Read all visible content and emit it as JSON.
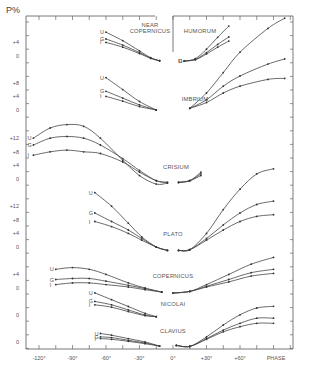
{
  "chart_data": {
    "type": "line",
    "title": "",
    "ylabel": "P%",
    "xlabel": "PHASE",
    "x_ticks": [
      "-120°",
      "-90°",
      "-60°",
      "-30°",
      "0°",
      "+30°",
      "+60°",
      "PHASE"
    ],
    "x_tick_values": [
      -120,
      -90,
      -60,
      -30,
      0,
      30,
      60
    ],
    "xlim": [
      -135,
      105
    ],
    "series_labels": [
      "U",
      "G",
      "I"
    ],
    "grid": false,
    "panels": [
      {
        "name": "NEAR COPERNICUS",
        "y_ticks": [
          "+4",
          "0"
        ],
        "baseline_px": 56,
        "series": [
          {
            "name": "U",
            "x": [
              -60,
              -45,
              -30,
              -20,
              -12
            ],
            "values": [
              7.0,
              4.5,
              1.5,
              -0.5,
              -1.4
            ]
          },
          {
            "name": "G",
            "x": [
              -60,
              -45,
              -30,
              -20,
              -12
            ],
            "values": [
              5.0,
              3.2,
              1.0,
              -0.6,
              -1.4
            ]
          },
          {
            "name": "I",
            "x": [
              -60,
              -45,
              -30,
              -20,
              -12
            ],
            "values": [
              4.0,
              2.6,
              0.7,
              -0.7,
              -1.4
            ]
          }
        ]
      },
      {
        "name": "HUMORUM",
        "y_ticks": [],
        "baseline_px": 56,
        "series": [
          {
            "name": "U",
            "x": [
              10,
              20,
              30,
              40,
              50
            ],
            "values": [
              -1.5,
              -0.8,
              2.0,
              5.5,
              8.8
            ]
          },
          {
            "name": "G",
            "x": [
              10,
              20,
              30,
              40,
              50
            ],
            "values": [
              -1.5,
              -1.0,
              1.0,
              3.4,
              5.6
            ]
          },
          {
            "name": "I",
            "x": [
              10,
              20,
              30,
              40,
              50
            ],
            "values": [
              -1.5,
              -1.1,
              0.6,
              2.6,
              4.4
            ]
          }
        ]
      },
      {
        "name": "IMBRIUM",
        "y_ticks": [
          "+8",
          "+4",
          "0"
        ],
        "baseline_px": 110,
        "series": [
          {
            "name": "U",
            "x": [
              -60,
              -45,
              -30,
              -15,
              15,
              30,
              45,
              60,
              85,
              100
            ],
            "values": [
              9.5,
              6.0,
              2.5,
              0.0,
              0.5,
              5.0,
              11.0,
              17.0,
              24.0,
              27.0
            ]
          },
          {
            "name": "G",
            "x": [
              -60,
              -45,
              -30,
              -15,
              15,
              30,
              45,
              60,
              85,
              100
            ],
            "values": [
              5.5,
              3.5,
              1.5,
              0.0,
              0.5,
              3.0,
              7.0,
              10.0,
              13.5,
              15.0
            ]
          },
          {
            "name": "I",
            "x": [
              -60,
              -45,
              -30,
              -15,
              15,
              30,
              45,
              60,
              85,
              100
            ],
            "values": [
              4.0,
              2.6,
              1.0,
              0.0,
              0.5,
              2.2,
              5.0,
              7.0,
              9.0,
              9.3
            ]
          }
        ]
      },
      {
        "name": "CRISIUM",
        "y_ticks": [
          "+12",
          "+8",
          "+4",
          "0"
        ],
        "baseline_px": 179,
        "series": [
          {
            "name": "U",
            "x": [
              -125,
              -110,
              -95,
              -80,
              -65,
              -45,
              -30,
              -15,
              -5,
              5,
              15,
              25
            ],
            "values": [
              12.0,
              15.0,
              16.0,
              15.5,
              12.0,
              5.5,
              1.0,
              -1.5,
              -1.2,
              -1.0,
              -0.5,
              2.0
            ]
          },
          {
            "name": "G",
            "x": [
              -125,
              -110,
              -95,
              -80,
              -65,
              -45,
              -30,
              -15,
              -5,
              5,
              15,
              25
            ],
            "values": [
              10.0,
              12.0,
              12.5,
              12.0,
              10.0,
              6.0,
              2.5,
              -0.5,
              -1.0,
              -1.0,
              -0.5,
              1.5
            ]
          },
          {
            "name": "I",
            "x": [
              -125,
              -110,
              -95,
              -80,
              -65,
              -45,
              -30,
              -15,
              -5,
              5,
              15,
              25
            ],
            "values": [
              7.0,
              8.0,
              8.5,
              8.0,
              7.5,
              5.0,
              2.0,
              -0.5,
              -1.0,
              -1.0,
              -0.5,
              1.0
            ]
          }
        ]
      },
      {
        "name": "PLATO",
        "y_ticks": [
          "+12",
          "+8",
          "+4",
          "0"
        ],
        "baseline_px": 247,
        "series": [
          {
            "name": "U",
            "x": [
              -70,
              -55,
              -40,
              -28,
              -15,
              -5,
              5,
              15,
              30,
              45,
              60,
              75,
              90
            ],
            "values": [
              16.0,
              12.0,
              7.0,
              3.0,
              0.0,
              -1.0,
              -1.0,
              -0.8,
              4.0,
              11.0,
              17.0,
              21.5,
              23.0
            ]
          },
          {
            "name": "G",
            "x": [
              -70,
              -55,
              -40,
              -28,
              -15,
              -5,
              5,
              15,
              30,
              45,
              60,
              75,
              90
            ],
            "values": [
              10.0,
              7.5,
              5.0,
              2.5,
              0.0,
              -1.0,
              -1.0,
              -0.8,
              2.5,
              6.5,
              10.0,
              12.5,
              13.5
            ]
          },
          {
            "name": "I",
            "x": [
              -70,
              -55,
              -40,
              -28,
              -15,
              -5,
              5,
              15,
              30,
              45,
              60,
              75,
              90
            ],
            "values": [
              7.5,
              6.0,
              4.0,
              2.0,
              0.0,
              -1.0,
              -1.0,
              -0.8,
              2.0,
              5.0,
              7.5,
              9.0,
              9.5
            ]
          }
        ]
      },
      {
        "name": "COPERNICUS",
        "y_ticks": [
          "+4",
          "0"
        ],
        "baseline_px": 288,
        "series": [
          {
            "name": "U",
            "x": [
              -105,
              -90,
              -75,
              -60,
              -40,
              -25,
              -10,
              0,
              15,
              30,
              50,
              70,
              90
            ],
            "values": [
              5.5,
              6.0,
              5.5,
              4.0,
              1.5,
              0.0,
              -1.2,
              -1.5,
              -1.0,
              1.0,
              4.0,
              7.0,
              9.0
            ]
          },
          {
            "name": "G",
            "x": [
              -105,
              -90,
              -75,
              -60,
              -40,
              -25,
              -10,
              0,
              15,
              30,
              50,
              70,
              90
            ],
            "values": [
              2.5,
              2.8,
              2.8,
              2.0,
              0.8,
              -0.2,
              -1.2,
              -1.5,
              -1.0,
              0.5,
              2.5,
              4.5,
              5.5
            ]
          },
          {
            "name": "I",
            "x": [
              -105,
              -90,
              -75,
              -60,
              -40,
              -25,
              -10,
              0,
              15,
              30,
              50,
              70,
              90
            ],
            "values": [
              1.0,
              1.5,
              1.5,
              1.0,
              0.3,
              -0.5,
              -1.2,
              -1.5,
              -1.0,
              0.3,
              1.8,
              3.5,
              4.3
            ]
          }
        ]
      },
      {
        "name": "NICOLAI",
        "y_ticks": [
          "0"
        ],
        "baseline_px": 315,
        "series": [
          {
            "name": "U",
            "x": [
              -70,
              -55,
              -40,
              -25,
              -15
            ],
            "values": [
              6.5,
              4.5,
              2.5,
              0.5,
              -0.5
            ]
          },
          {
            "name": "G",
            "x": [
              -70,
              -55,
              -40,
              -25,
              -15
            ],
            "values": [
              4.0,
              3.0,
              1.5,
              0.0,
              -0.5
            ]
          },
          {
            "name": "I",
            "x": [
              -70,
              -55,
              -40,
              -25,
              -15
            ],
            "values": [
              3.0,
              2.3,
              1.0,
              -0.2,
              -0.5
            ]
          }
        ]
      },
      {
        "name": "CLAVIUS",
        "y_ticks": [
          "0"
        ],
        "baseline_px": 342,
        "series": [
          {
            "name": "U",
            "x": [
              -65,
              -55,
              -40,
              -25,
              -12,
              3,
              15,
              30,
              45,
              60,
              75,
              90
            ],
            "values": [
              2.5,
              2.0,
              1.0,
              0.0,
              -1.2,
              -1.0,
              -1.3,
              1.5,
              5.0,
              8.0,
              10.0,
              10.5
            ]
          },
          {
            "name": "G",
            "x": [
              -65,
              -55,
              -40,
              -25,
              -12,
              3,
              15,
              30,
              45,
              60,
              75,
              90
            ],
            "values": [
              1.5,
              1.3,
              0.5,
              -0.3,
              -1.2,
              -1.0,
              -1.3,
              1.0,
              3.5,
              5.5,
              7.0,
              7.0
            ]
          },
          {
            "name": "I",
            "x": [
              -65,
              -55,
              -40,
              -25,
              -12,
              3,
              15,
              30,
              45,
              60,
              75,
              90
            ],
            "values": [
              1.0,
              0.8,
              0.2,
              -0.5,
              -1.2,
              -1.0,
              -1.3,
              0.8,
              3.0,
              4.5,
              5.5,
              5.5
            ]
          }
        ]
      }
    ],
    "y_axis_tick_labels": [
      "+4",
      "0",
      "+8",
      "+4",
      "0",
      "+12",
      "+8",
      "+4",
      "0",
      "+12",
      "+8",
      "+4",
      "0",
      "+4",
      "0",
      "0",
      "0"
    ]
  },
  "labels": {
    "ylabel": "P%",
    "xlabel": "PHASE"
  }
}
